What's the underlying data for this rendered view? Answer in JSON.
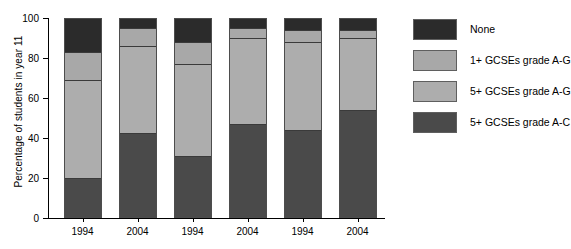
{
  "chart_data": {
    "type": "bar",
    "subtype": "stacked-bar-100",
    "title": "",
    "xlabel": "",
    "ylabel": "Percentage of students in year 11",
    "ylim": [
      0,
      100
    ],
    "yticks": [
      0,
      20,
      40,
      60,
      80,
      100
    ],
    "ytick_labels": [
      "0",
      "20",
      "40",
      "60",
      "80",
      "100"
    ],
    "grid": false,
    "legend_position": "right",
    "categories": [
      "1994",
      "2004",
      "1994",
      "2004",
      "1994",
      "2004"
    ],
    "series": [
      {
        "name": "5+ GCSEs grade A-C",
        "color": "#4a4a4a",
        "values": [
          20,
          42.5,
          31,
          47,
          44,
          54
        ]
      },
      {
        "name": "5+ GCSEs grade A-G",
        "color": "#adadad",
        "values": [
          49,
          43.5,
          46,
          43,
          44,
          36
        ]
      },
      {
        "name": "1+ GCSEs grade A-G",
        "color": "#a8a8a8",
        "values": [
          14,
          9,
          11,
          5,
          6,
          4
        ]
      },
      {
        "name": "None",
        "color": "#2b2b2b",
        "values": [
          17,
          5,
          12,
          5,
          6,
          6
        ]
      }
    ],
    "cumulative_tops": [
      [
        20,
        69,
        83,
        100
      ],
      [
        42.5,
        86,
        95,
        100
      ],
      [
        31,
        77,
        88,
        100
      ],
      [
        47,
        90,
        95,
        100
      ],
      [
        44,
        88,
        94,
        100
      ],
      [
        54,
        90,
        94,
        100
      ]
    ],
    "legend_entries": [
      {
        "label": "None",
        "color": "#2b2b2b"
      },
      {
        "label": "1+ GCSEs grade A-G",
        "color": "#a8a8a8"
      },
      {
        "label": "5+ GCSEs grade A-G",
        "color": "#adadad"
      },
      {
        "label": "5+ GCSEs grade A-C",
        "color": "#4a4a4a"
      }
    ],
    "colors": {
      "none": "#2b2b2b",
      "one_plus_ag": "#a8a8a8",
      "five_plus_ag": "#adadad",
      "five_plus_ac": "#4a4a4a",
      "axis": "#000000",
      "background": "#ffffff"
    }
  }
}
